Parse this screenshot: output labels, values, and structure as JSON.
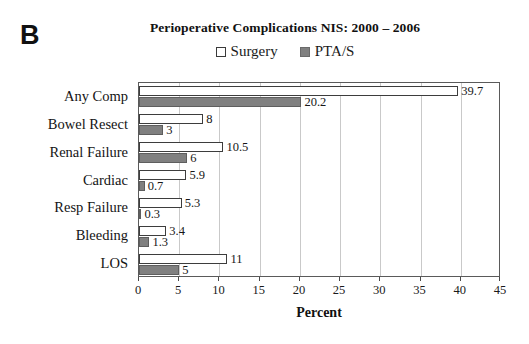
{
  "panel": {
    "label": "B"
  },
  "chart_data": {
    "type": "bar",
    "orientation": "horizontal",
    "title": "Perioperative Complications NIS: 2000 – 2006",
    "xlabel": "Percent",
    "ylabel": "",
    "xlim": [
      0,
      45
    ],
    "xticks": [
      0,
      5,
      10,
      15,
      20,
      25,
      30,
      35,
      40,
      45
    ],
    "grid": true,
    "grid_axis": "x",
    "legend_position": "top-center",
    "categories": [
      "Any Comp",
      "Bowel Resect",
      "Renal Failure",
      "Cardiac",
      "Resp Failure",
      "Bleeding",
      "LOS"
    ],
    "series": [
      {
        "name": "Surgery",
        "color": "#ffffff",
        "edge_color": "#3d3d3d",
        "values": [
          39.7,
          8,
          10.5,
          5.9,
          5.3,
          3.4,
          11
        ],
        "labels": [
          "39.7",
          "8",
          "10.5",
          "5.9",
          "5.3",
          "3.4",
          "11"
        ]
      },
      {
        "name": "PTA/S",
        "color": "#808080",
        "edge_color": "#5e5e5e",
        "values": [
          20.2,
          3,
          6,
          0.7,
          0.3,
          1.3,
          5
        ],
        "labels": [
          "20.2",
          "3",
          "6",
          "0.7",
          "0.3",
          "1.3",
          "5"
        ]
      }
    ]
  },
  "legend": {
    "items": [
      {
        "label": "Surgery",
        "swatch": "open-square-icon"
      },
      {
        "label": "PTA/S",
        "swatch": "filled-square-icon"
      }
    ]
  }
}
